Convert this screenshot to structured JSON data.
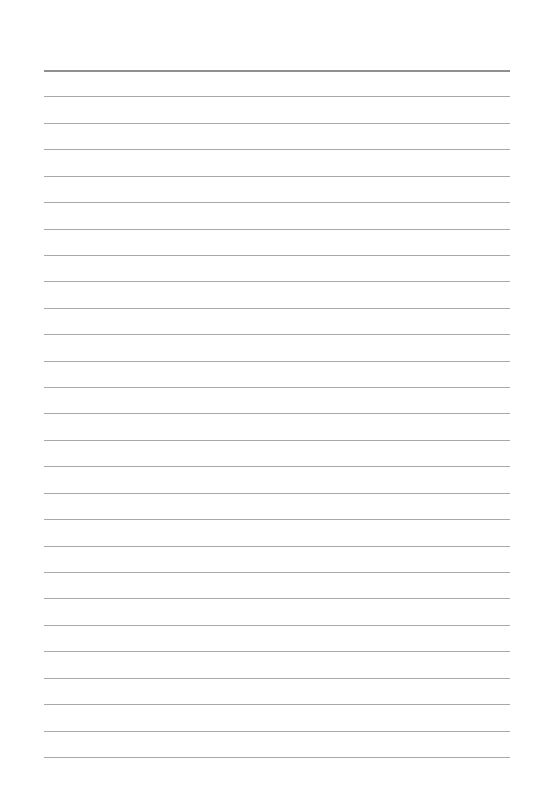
{
  "page": {
    "type": "lined-paper",
    "background_color": "#ffffff",
    "line_color": "#a9a9a9",
    "header_line_color": "#8f8f8f",
    "line_count": 27,
    "first_line_y": 70,
    "line_spacing": 26.42,
    "line_left": 44,
    "line_width": 466
  }
}
